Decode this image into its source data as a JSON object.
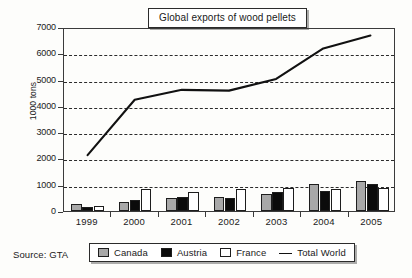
{
  "chart_data": {
    "type": "bar",
    "title": "Global exports of wood pellets",
    "xlabel": "",
    "ylabel": "1000 tons",
    "ylim": [
      0,
      7000
    ],
    "ytick_step": 1000,
    "yticks": [
      "0",
      "1000",
      "2000",
      "3000",
      "4000",
      "5000",
      "6000",
      "7000"
    ],
    "grid": true,
    "legend_position": "bottom",
    "categories": [
      "1999",
      "2000",
      "2001",
      "2002",
      "2003",
      "2004",
      "2005"
    ],
    "series": [
      {
        "name": "Canada",
        "type": "bar",
        "color": "#a8a8a8",
        "values": [
          280,
          350,
          500,
          520,
          640,
          1030,
          1150
        ]
      },
      {
        "name": "Austria",
        "type": "bar",
        "color": "#0b0b0b",
        "values": [
          170,
          430,
          540,
          500,
          720,
          780,
          1010
        ]
      },
      {
        "name": "France",
        "type": "bar",
        "color": "#ffffff",
        "values": [
          180,
          820,
          730,
          840,
          860,
          820,
          890
        ]
      },
      {
        "name": "Total World",
        "type": "line",
        "color": "#111111",
        "values": [
          2150,
          4280,
          4660,
          4630,
          5080,
          6250,
          6750
        ]
      }
    ],
    "source": "Source: GTA"
  },
  "legend": {
    "items": [
      {
        "label": "Canada",
        "marker": "square-gray-swatch"
      },
      {
        "label": "Austria",
        "marker": "square-black-swatch"
      },
      {
        "label": "France",
        "marker": "square-white-swatch"
      },
      {
        "label": "Total World",
        "marker": "line-swatch"
      }
    ]
  }
}
